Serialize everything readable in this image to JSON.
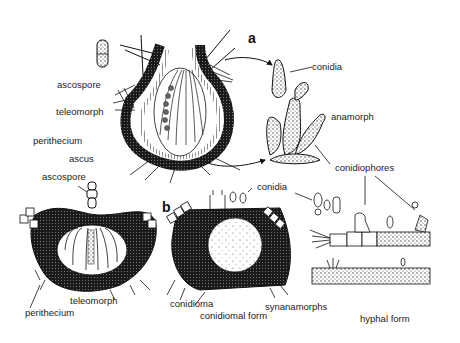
{
  "figure": {
    "panels": {
      "a": "a",
      "b": "b"
    },
    "labels": {
      "ascospore_top": "ascospore",
      "teleomorph_top": "teleomorph",
      "perithecium_top": "perithecium",
      "ascus": "ascus",
      "conidia_top": "conidia",
      "anamorph": "anamorph",
      "conidiophores": "conidiophores",
      "ascospore_bottom": "ascospore",
      "teleomorph_bottom": "teleomorph",
      "perithecium_bottom": "perithecium",
      "conidia_bottom": "conidia",
      "conidioma": "conidioma",
      "conidiomal_form": "conidiomal form",
      "synanamorphs": "synanamorphs",
      "hyphal_form": "hyphal form"
    },
    "colors": {
      "ink": "#111111",
      "stipple": "#444444",
      "background": "#ffffff"
    }
  }
}
